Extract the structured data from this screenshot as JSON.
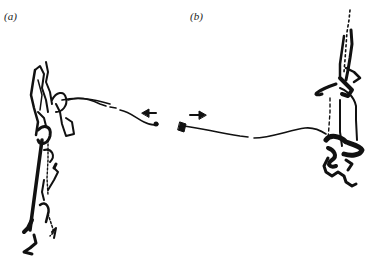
{
  "figure": {
    "panels": [
      {
        "label": "(a)",
        "direction_arrow": "left",
        "description": "track trace on left with trail extending right"
      },
      {
        "label": "(b)",
        "direction_arrow": "right",
        "description": "track trace on right with trail extending left"
      }
    ],
    "colors": {
      "ink": "#111111",
      "background": "#ffffff"
    }
  }
}
